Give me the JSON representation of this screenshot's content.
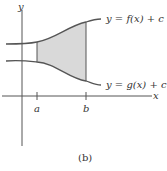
{
  "figure": {
    "caption": "(b)",
    "axes": {
      "x_label": "x",
      "y_label": "y"
    },
    "ticks": {
      "a": "a",
      "b": "b"
    },
    "curves": {
      "top_label": "y = f(x) + c",
      "bottom_label": "y = g(x) + c"
    },
    "colors": {
      "shade": "#d9d9d9",
      "stroke": "#555555"
    }
  }
}
